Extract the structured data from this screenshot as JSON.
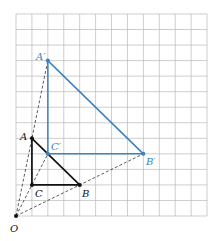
{
  "diagram": {
    "type": "dilation",
    "grid": {
      "columns": 12,
      "rows": 13,
      "origin_px": [
        16,
        216
      ],
      "cell_w": 15.92,
      "cell_h": 15.54,
      "line_color": "#b8b8b8"
    },
    "center": {
      "label": "O",
      "x": 0,
      "y": 0
    },
    "scale_factor": 2,
    "original_triangle": {
      "color": "#111111",
      "vertices": [
        {
          "label": "A",
          "x": 1,
          "y": 5
        },
        {
          "label": "B",
          "x": 4,
          "y": 2
        },
        {
          "label": "C",
          "x": 1,
          "y": 2
        }
      ]
    },
    "image_triangle": {
      "color": "#3b82c4",
      "vertices": [
        {
          "label": "A′",
          "x": 2,
          "y": 10
        },
        {
          "label": "B′",
          "x": 8,
          "y": 4
        },
        {
          "label": "C′",
          "x": 2,
          "y": 4
        }
      ]
    },
    "rays": [
      {
        "from": "O",
        "to": "A′"
      },
      {
        "from": "O",
        "to": "C′"
      },
      {
        "from": "O",
        "to": "B′"
      }
    ]
  },
  "labels": {
    "O": "O",
    "A": "A",
    "B": "B",
    "C": "C",
    "A_prime": "A′",
    "B_prime": "B′",
    "C_prime": "C′"
  }
}
